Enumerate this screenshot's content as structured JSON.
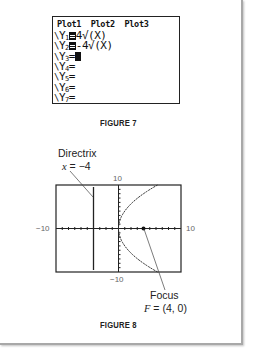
{
  "figure7": {
    "caption": "FIGURE 7",
    "plot_header": "Plot1  Plot2  Plot3",
    "equations": [
      {
        "prefix": "\\",
        "name": "Y",
        "index": "1",
        "selected": true,
        "expr": "4√(X)"
      },
      {
        "prefix": "\\",
        "name": "Y",
        "index": "2",
        "selected": true,
        "expr": "-4√(X)"
      },
      {
        "prefix": "\\",
        "name": "Y",
        "index": "3",
        "selected": false,
        "expr": "",
        "cursor": true
      },
      {
        "prefix": "\\",
        "name": "Y",
        "index": "4",
        "selected": false,
        "expr": ""
      },
      {
        "prefix": "\\",
        "name": "Y",
        "index": "5",
        "selected": false,
        "expr": ""
      },
      {
        "prefix": "\\",
        "name": "Y",
        "index": "6",
        "selected": false,
        "expr": ""
      },
      {
        "prefix": "\\",
        "name": "Y",
        "index": "7",
        "selected": false,
        "expr": ""
      }
    ],
    "equals": "="
  },
  "figure8": {
    "caption": "FIGURE 8",
    "directrix_label": "Directrix",
    "directrix_eq_var": "x",
    "directrix_eq_rest": " = −4",
    "focus_label": "Focus",
    "focus_eq_var": "F",
    "focus_eq_rest": " = (4, 0)",
    "ticks": {
      "x_min": "−10",
      "x_max": "10",
      "y_min": "−10",
      "y_max": "10"
    }
  },
  "chart_data": {
    "type": "line",
    "title": "FIGURE 8",
    "xlim": [
      -10,
      10
    ],
    "ylim": [
      -10,
      10
    ],
    "xscale": 1,
    "yscale": 1,
    "series": [
      {
        "name": "Y1 = 4√(X)",
        "x": [
          0,
          1,
          2,
          4,
          6,
          8,
          10
        ],
        "y": [
          0,
          4,
          5.66,
          8,
          9.8,
          11.31,
          12.65
        ]
      },
      {
        "name": "Y2 = -4√(X)",
        "x": [
          0,
          1,
          2,
          4,
          6,
          8,
          10
        ],
        "y": [
          0,
          -4,
          -5.66,
          -8,
          -9.8,
          -11.31,
          -12.65
        ]
      },
      {
        "name": "Directrix x = -4",
        "x": [
          -4,
          -4
        ],
        "y": [
          -10,
          10
        ]
      }
    ],
    "annotations": [
      {
        "text": "Directrix x = −4",
        "x": -4,
        "y": 10
      },
      {
        "text": "Focus F = (4, 0)",
        "x": 4,
        "y": 0
      }
    ],
    "points": [
      {
        "name": "Focus",
        "x": 4,
        "y": 0
      }
    ],
    "grid": false
  }
}
